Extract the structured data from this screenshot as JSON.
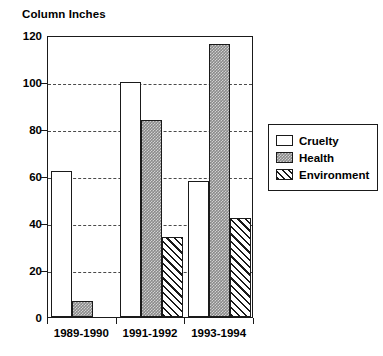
{
  "chart_data": {
    "type": "bar",
    "title": "",
    "ylabel": "Column Inches",
    "xlabel": "",
    "ylim": [
      0,
      120
    ],
    "yticks": [
      0,
      20,
      40,
      60,
      80,
      100,
      120
    ],
    "grid": true,
    "legend_position": "right",
    "categories": [
      "1989-1990",
      "1991-1992",
      "1993-1994"
    ],
    "series": [
      {
        "name": "Cruelty",
        "values": [
          62,
          100,
          58
        ],
        "fill": "#ffffff",
        "pattern": "solid-white"
      },
      {
        "name": "Health",
        "values": [
          7,
          84,
          116
        ],
        "fill": "#8a8a8a",
        "pattern": "dotted-gray"
      },
      {
        "name": "Environment",
        "values": [
          0,
          34,
          42
        ],
        "fill": "#ffffff",
        "pattern": "diagonal-hatch"
      }
    ]
  },
  "axis": {
    "y_title": "Column Inches",
    "tick_labels": [
      "120",
      "100",
      "80",
      "60",
      "40",
      "20",
      "0"
    ]
  },
  "legend": {
    "items": [
      {
        "label": "Cruelty"
      },
      {
        "label": "Health"
      },
      {
        "label": "Environment"
      }
    ]
  },
  "xaxis": {
    "labels": [
      "1989-1990",
      "1991-1992",
      "1993-1994"
    ]
  },
  "colors": {
    "axis": "#1a1a1a",
    "grid": "#4a4a4a",
    "health_fill": "#8a8a8a",
    "background": "#ffffff"
  }
}
